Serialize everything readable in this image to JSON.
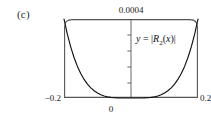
{
  "figure": {
    "caption": "(c)",
    "formula": "y = |R2(x)|",
    "formula_parts": {
      "lhs": "y",
      "equals": "=",
      "bar_open": "|",
      "fn": "R",
      "sub": "2",
      "arg_open": "(",
      "arg": "x",
      "arg_close": ")",
      "bar_close": "|"
    }
  },
  "axes": {
    "y_max_label": "0.0004",
    "x_min_label": "−0.2",
    "x_zero_label": "0",
    "x_max_label": "0.2",
    "y_tick_count": 4,
    "frame_color": "#555555",
    "curve_color": "#111111"
  },
  "chart_data": {
    "type": "line",
    "title": "",
    "subtitle": "",
    "xlabel": "",
    "ylabel": "",
    "xlim": [
      -0.2,
      0.2
    ],
    "ylim": [
      0,
      0.0004
    ],
    "grid": false,
    "legend": null,
    "annotations": [
      {
        "text": "y = |R2(x)|",
        "x": 0.055,
        "y": 0.00031
      },
      {
        "text": "(c)",
        "x": null,
        "y": null
      }
    ],
    "xticks": [
      -0.2,
      0,
      0.2
    ],
    "xticklabels": [
      "−0.2",
      "0",
      "0.2"
    ],
    "yticks": [
      0.0004
    ],
    "yticklabels": [
      "0.0004"
    ],
    "series": [
      {
        "name": "y = |R2(x)|",
        "x": [
          -0.2,
          -0.19,
          -0.18,
          -0.17,
          -0.16,
          -0.15,
          -0.14,
          -0.13,
          -0.12,
          -0.11,
          -0.1,
          -0.09,
          -0.08,
          -0.07,
          -0.06,
          -0.05,
          -0.04,
          -0.03,
          -0.02,
          -0.01,
          0,
          0.01,
          0.02,
          0.03,
          0.04,
          0.05,
          0.06,
          0.07,
          0.08,
          0.09,
          0.1,
          0.11,
          0.12,
          0.13,
          0.14,
          0.15,
          0.16,
          0.17,
          0.18,
          0.19,
          0.2
        ],
        "y": [
          0.0004,
          0.000323,
          0.000259,
          0.000205,
          0.00016,
          0.000124,
          9.41e-05,
          7.02e-05,
          5.13e-05,
          3.65e-05,
          2.5e-05,
          1.64e-05,
          1.02e-05,
          5.88e-06,
          3.11e-06,
          1.46e-06,
          5.7e-07,
          1.7e-07,
          3e-08,
          2e-09,
          0.0,
          2e-09,
          3e-08,
          1.7e-07,
          5.7e-07,
          1.46e-06,
          3.11e-06,
          5.88e-06,
          1.02e-05,
          1.64e-05,
          2.5e-05,
          3.65e-05,
          5.13e-05,
          7.02e-05,
          9.41e-05,
          0.000124,
          0.00016,
          0.000205,
          0.000259,
          0.000323,
          0.0004
        ]
      }
    ]
  }
}
